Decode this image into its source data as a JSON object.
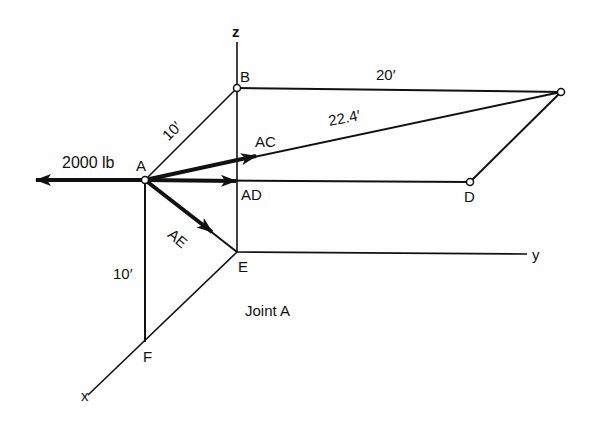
{
  "figure": {
    "caption": "Joint A",
    "axes": {
      "x": "x",
      "y": "y",
      "z": "z"
    },
    "points": {
      "A": "A",
      "B": "B",
      "D": "D",
      "E": "E",
      "F": "F"
    },
    "forces": {
      "applied": "2000 lb",
      "AC": "AC",
      "AD": "AD",
      "AE": "AE"
    },
    "dimensions": {
      "AB": "10′",
      "BC": "20′",
      "AC": "22.4′",
      "AF": "10′"
    }
  }
}
